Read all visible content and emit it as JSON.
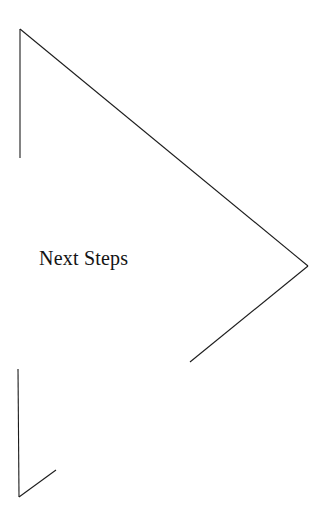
{
  "slide": {
    "title": "Next Steps",
    "background_color": "#ffffff",
    "width": 327,
    "height": 522
  },
  "title_style": {
    "color": "#141414",
    "font_size_px": 20,
    "x": 39,
    "baseline_y": 270
  },
  "decoration": {
    "name": "chevron-bracket-outline",
    "stroke_color": "#1c1c1c",
    "stroke_width": 1,
    "strokes": [
      {
        "name": "top-left-vertical-stroke",
        "points": "20,158 20,29"
      },
      {
        "name": "top-long-diagonal-stroke",
        "points": "20,29 308,266"
      },
      {
        "name": "chevron-lower-diagonal-stroke",
        "points": "308,266 190,362"
      },
      {
        "name": "bottom-left-vertical-stroke",
        "points": "18,369 19,497"
      },
      {
        "name": "bottom-left-diagonal-stroke",
        "points": "19,497 56,470"
      }
    ]
  }
}
